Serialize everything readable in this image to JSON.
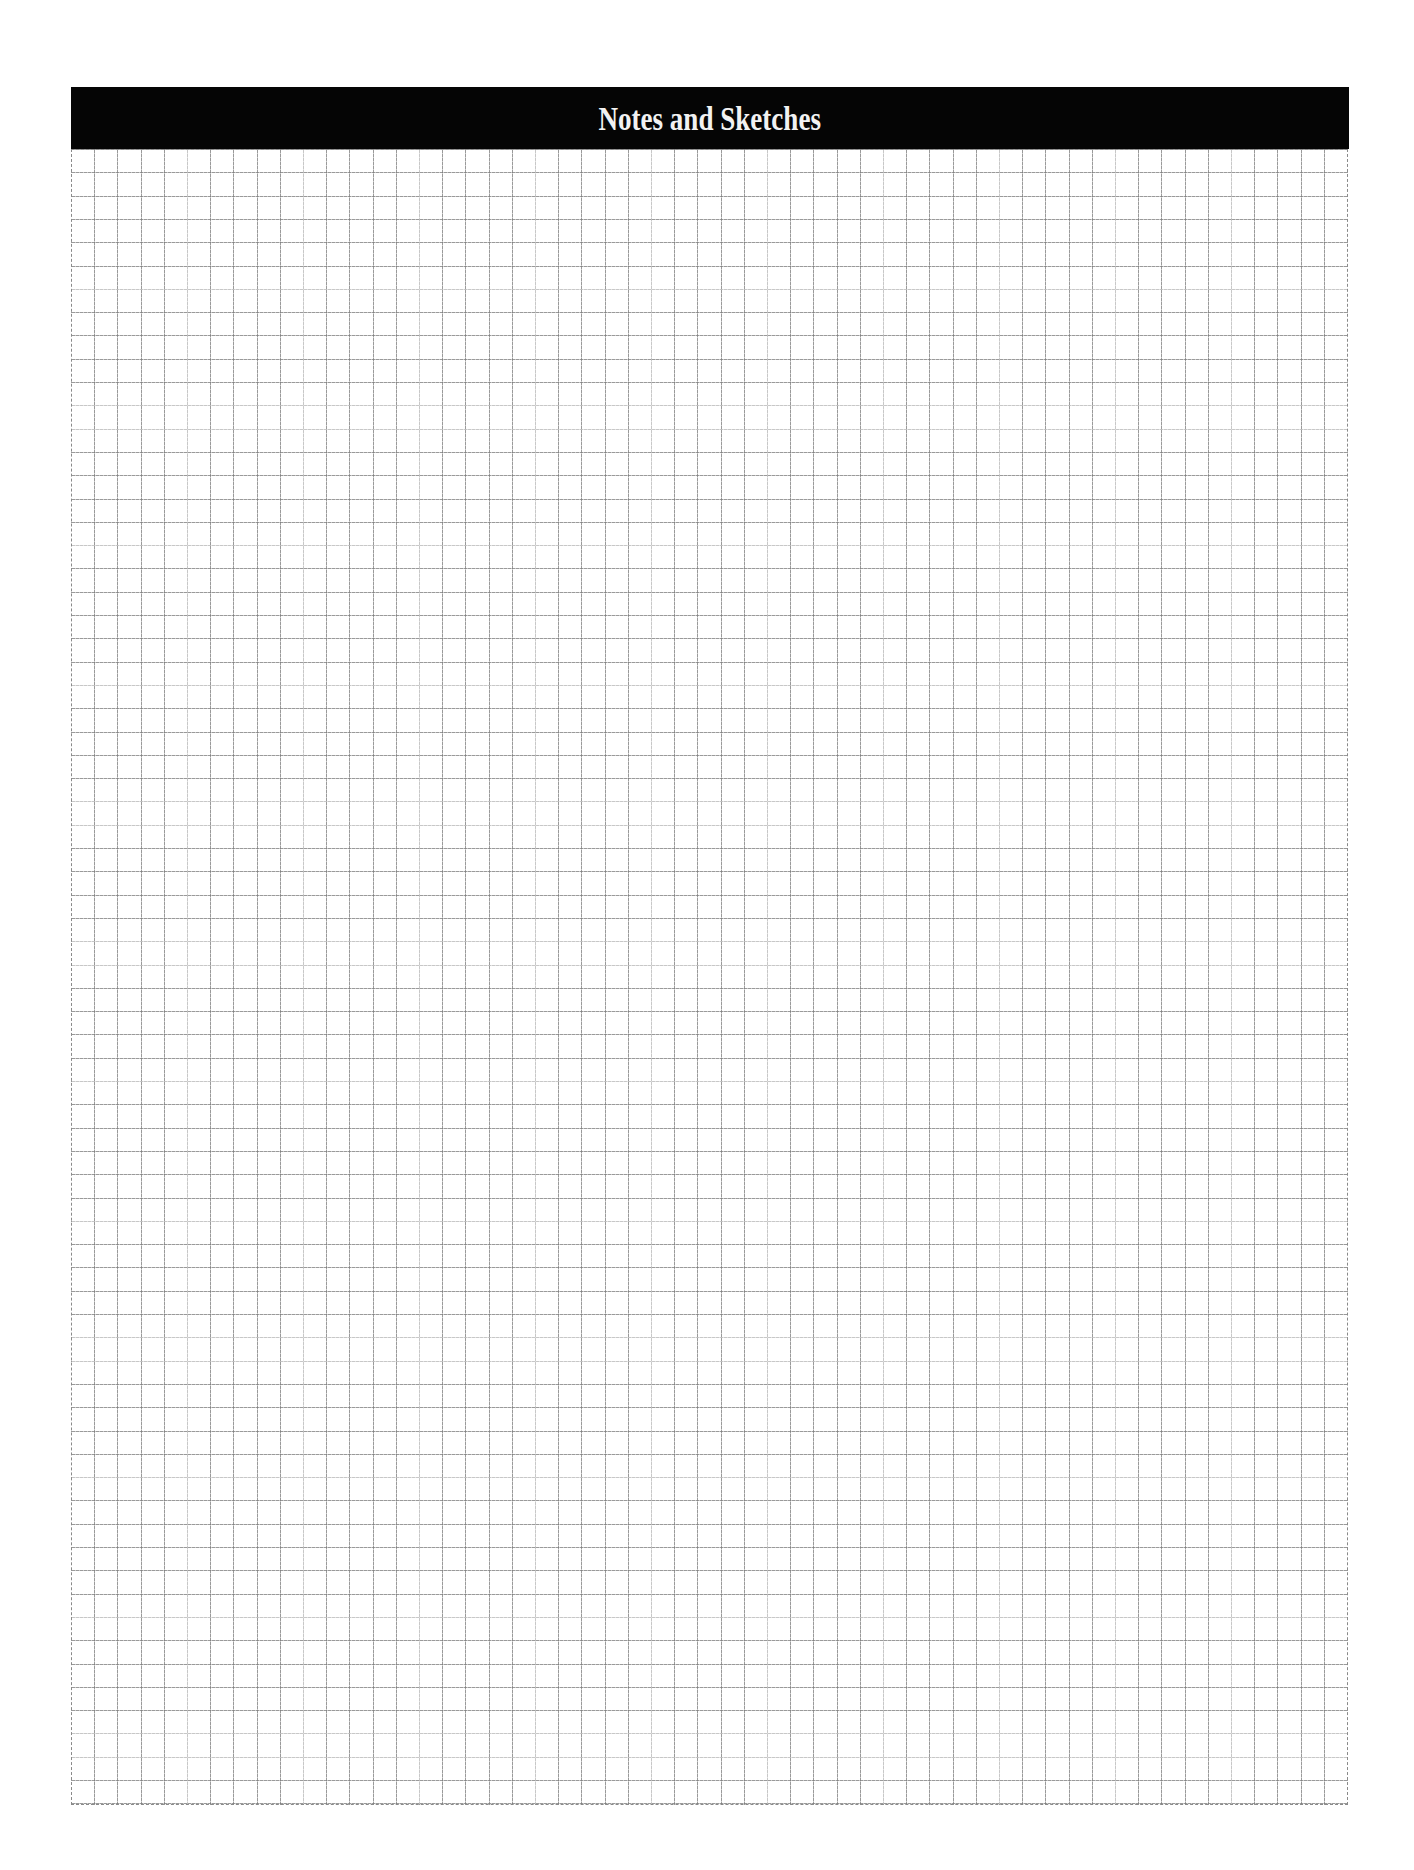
{
  "header": {
    "title": "Notes and Sketches",
    "background_color": "#050505",
    "text_color": "#f2f2f2"
  },
  "grid": {
    "columns": 55,
    "rows": 71,
    "cell_size_px": 23,
    "line_color": "#8a8a8a",
    "line_style": "dashed"
  }
}
